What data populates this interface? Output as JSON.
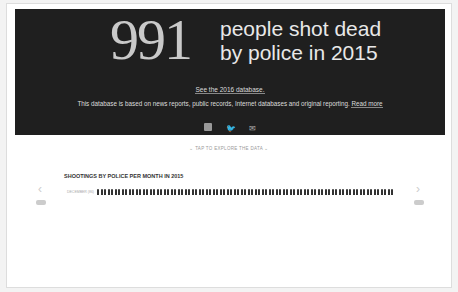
{
  "hero": {
    "count": "991",
    "headline_line1": "people shot dead",
    "headline_line2": "by police in 2015",
    "see_link": "See the 2016 database.",
    "description": "This database is based on news reports, public records, Internet databases and original reporting.",
    "read_more": "Read more",
    "social": [
      "facebook-icon",
      "twitter-icon",
      "email-icon"
    ]
  },
  "tap_text": "⌄ TAP TO EXPLORE THE DATA ⌄",
  "chart": {
    "title": "SHOOTINGS BY POLICE PER MONTH IN 2015",
    "months": [
      {
        "label": "DECEMBER (86)",
        "count": 86
      },
      {
        "label": "NOVEMBER (78)",
        "count": 78
      },
      {
        "label": "OCTOBER (82)",
        "count": 82
      },
      {
        "label": "SEPTEMBER (82)",
        "count": 82
      },
      {
        "label": "AUGUST (94)",
        "count": 94
      },
      {
        "label": "JULY (104)",
        "count": 104
      }
    ],
    "prev": "‹",
    "next": "›"
  }
}
